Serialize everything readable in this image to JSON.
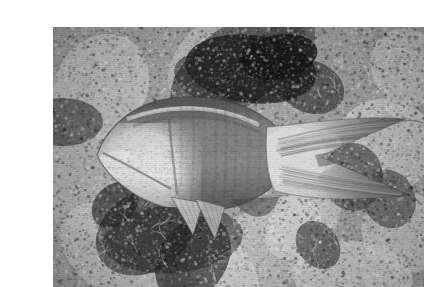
{
  "page": {
    "background_color": "#ffffff",
    "width": 398,
    "height": 284
  },
  "photo": {
    "title": "Parrotfish swimming over a coral reef",
    "alt_text": "Black and white underwater photograph of a parrotfish with a blunt pale snout and a crescent-shaped tail swimming above mottled coral rubble",
    "medium": "black-and-white photograph",
    "orientation": "landscape",
    "frame": {
      "x": 13,
      "y": 11,
      "width": 371,
      "height": 260
    },
    "palette": {
      "background_mid": "#8d8d8d",
      "reef_light": "#d8d8d8",
      "reef_highlight": "#f2f2f2",
      "reef_mid": "#9a9a9a",
      "reef_dark": "#3a3a3a",
      "reef_shadow": "#141414",
      "fish_body": "#7a7a7a",
      "fish_body_dark": "#5e5e5e",
      "fish_head_light": "#e2e2e2",
      "fish_tail_light": "#cfcfcf",
      "fish_outline": "#2e2e2e"
    },
    "subject": {
      "name": "parrotfish",
      "facing": "left",
      "features": [
        "blunt pale snout",
        "light dorsal stripe along the back",
        "scaled flank with faint vertical banding",
        "pale triangular pelvic fins",
        "lunate crescent tail with trailing filaments"
      ]
    },
    "scene": {
      "name": "coral reef floor",
      "elements": [
        "mottled coral rubble",
        "dark crevices and shadowed holes",
        "bright encrusting coral patches",
        "dark algal mass upper centre"
      ]
    }
  }
}
